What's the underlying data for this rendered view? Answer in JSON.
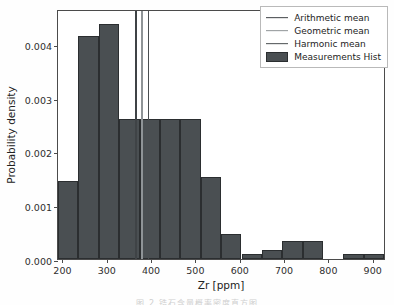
{
  "chart_data": {
    "type": "bar",
    "title": "",
    "xlabel": "Zr [ppm]",
    "ylabel": "Probability density",
    "xlim": [
      190,
      930
    ],
    "ylim": [
      0.0,
      0.00465
    ],
    "grid": false,
    "legend_position": "upper right",
    "x_ticks": [
      200,
      300,
      400,
      500,
      600,
      700,
      800,
      900
    ],
    "x_tick_labels": [
      "200",
      "300",
      "400",
      "500",
      "600",
      "700",
      "800",
      "900"
    ],
    "y_ticks": [
      0.0,
      0.001,
      0.002,
      0.003,
      0.004
    ],
    "y_tick_labels": [
      "0.000",
      "0.001",
      "0.002",
      "0.003",
      "0.004"
    ],
    "bin_edges": [
      190,
      236,
      282,
      328,
      374,
      420,
      466,
      512,
      558,
      604,
      650,
      696,
      742,
      788,
      834,
      880,
      926
    ],
    "bin_labels": [
      "190-236",
      "236-282",
      "282-328",
      "328-374",
      "374-420",
      "420-466",
      "466-512",
      "512-558",
      "558-604",
      "604-650",
      "650-696",
      "696-742",
      "742-788",
      "788-834",
      "834-880",
      "880-926"
    ],
    "values": [
      0.00145,
      0.00415,
      0.00438,
      0.0026,
      0.0026,
      0.0026,
      0.0026,
      0.00153,
      0.00047,
      0.0001,
      0.00016,
      0.00034,
      0.00034,
      0.0,
      0.0001,
      0.0001
    ],
    "vertical_lines": [
      {
        "name": "Arithmetic mean",
        "x": 364,
        "color": "#3f4346"
      },
      {
        "name": "Geometric mean",
        "x": 378,
        "color": "#8f9497"
      },
      {
        "name": "Harmonic mean",
        "x": 392,
        "color": "#4a4e51"
      }
    ],
    "legend_entries": [
      {
        "label": "Arithmetic mean",
        "marker": "line",
        "color": "#3f4346"
      },
      {
        "label": "Geometric mean",
        "marker": "line",
        "color": "#8f9497"
      },
      {
        "label": "Harmonic mean",
        "marker": "line",
        "color": "#4a4e51"
      },
      {
        "label": "Measurements Hist",
        "marker": "patch",
        "color": "#4a4f52"
      }
    ],
    "bar_color": "#4a4f52",
    "bar_edge_color": "#2b2e30"
  },
  "caption": "图 2 锆石含量概率密度直方图"
}
